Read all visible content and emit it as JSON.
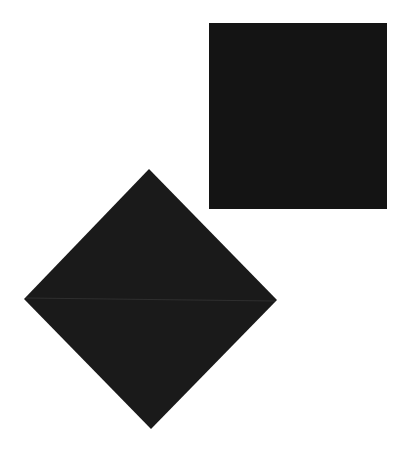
{
  "background_color": "#ffffff",
  "shapes": [
    {
      "id": "square",
      "kind": "square",
      "fill": "#141414"
    },
    {
      "id": "diamond",
      "kind": "diamond",
      "fill": "#1a1a1a",
      "seam_color": "#5a5a5a"
    }
  ]
}
